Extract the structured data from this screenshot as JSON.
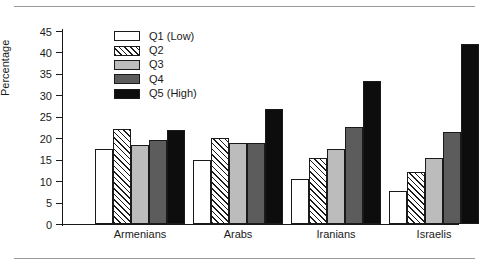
{
  "figure": {
    "has_top_rule": true,
    "has_bottom_rule": true,
    "background": "#ffffff",
    "frame_color": "#9a9a9a"
  },
  "chart_data": {
    "type": "bar",
    "title": "",
    "subtitle": "",
    "xlabel": "",
    "ylabel": "Percentage",
    "categories": [
      "Armenians",
      "Arabs",
      "Iranians",
      "Israelis"
    ],
    "ylim": [
      0,
      45
    ],
    "yticks": [
      0,
      5,
      10,
      15,
      20,
      25,
      30,
      35,
      40,
      45
    ],
    "ytick_labels": [
      "0",
      "5",
      "10",
      "15",
      "20",
      "25",
      "30",
      "35",
      "40",
      "45"
    ],
    "grid": false,
    "legend_position": "upper-center-left",
    "series": [
      {
        "name": "Q1 (Low)",
        "color": "#ffffff",
        "pattern": "solid",
        "values": [
          17.6,
          14.9,
          10.4,
          7.8
        ]
      },
      {
        "name": "Q2",
        "color": "#ffffff",
        "pattern": "diagonal-hatch",
        "values": [
          22.2,
          20.0,
          15.3,
          12.2
        ]
      },
      {
        "name": "Q3",
        "color": "#bcbcbc",
        "pattern": "solid",
        "values": [
          18.4,
          19.0,
          17.6,
          15.3
        ]
      },
      {
        "name": "Q4",
        "color": "#5c5c5c",
        "pattern": "solid",
        "values": [
          19.7,
          18.8,
          22.6,
          21.4
        ]
      },
      {
        "name": "Q5 (High)",
        "color": "#0d0d0d",
        "pattern": "solid",
        "values": [
          21.9,
          26.8,
          33.4,
          41.9
        ]
      }
    ]
  }
}
